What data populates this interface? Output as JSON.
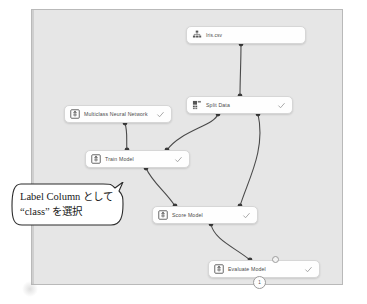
{
  "app": {
    "type": "ml-pipeline-designer-canvas",
    "canvas_background": "#e6e6e6",
    "node_background": "#fefefe",
    "wire_color": "#4a4a4a",
    "check_color": "#9a9a9a"
  },
  "nodes": [
    {
      "id": "iris",
      "label": "Iris.csv",
      "icon": "dataset-icon",
      "status_icon": "",
      "has_check": false
    },
    {
      "id": "split",
      "label": "Split Data",
      "icon": "split-data-icon",
      "status_icon": "check-icon",
      "has_check": true
    },
    {
      "id": "mnn",
      "label": "Multiclass Neural Network",
      "icon": "algorithm-icon",
      "status_icon": "check-icon",
      "has_check": true
    },
    {
      "id": "train",
      "label": "Train Model",
      "icon": "train-model-icon",
      "status_icon": "check-icon",
      "has_check": true
    },
    {
      "id": "score",
      "label": "Score Model",
      "icon": "score-model-icon",
      "status_icon": "check-icon",
      "has_check": true
    },
    {
      "id": "eval",
      "label": "Evaluate Model",
      "icon": "evaluate-model-icon",
      "status_icon": "check-icon",
      "has_check": true
    }
  ],
  "badge": {
    "count": "1"
  },
  "callout": {
    "line1": "Label Column として",
    "line2": "“class” を選択"
  }
}
